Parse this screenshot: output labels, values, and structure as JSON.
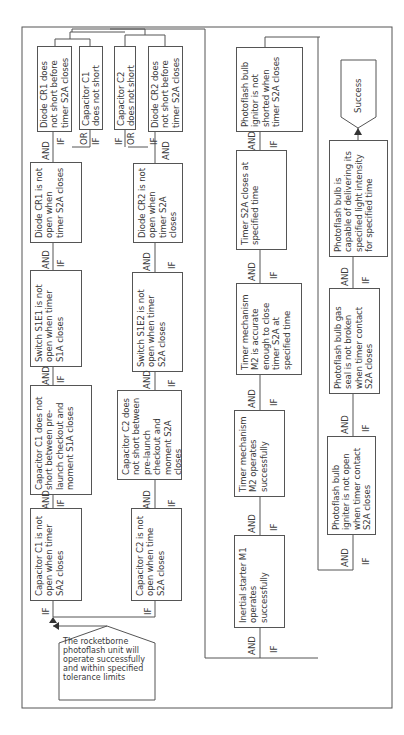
{
  "diagram": {
    "orientation": "rotated 90 degrees counter-clockwise",
    "top_event": "The rocketborne photoflash unit will operate successfully and within specified tolerance limits",
    "top_event_lines": [
      "The",
      "rocketborne",
      "photoflash",
      "unit will oper-",
      "ate successfully",
      "and within",
      "specified",
      "tolerance",
      "limits"
    ],
    "success": "Success",
    "connectors": {
      "and": "AND",
      "if": "IF",
      "or": "OR"
    },
    "branch1": {
      "c1_open": "Capacitor C1 is not open when timer SA2 closes",
      "c1_short": "Capacitor C1 does not short between pre-launch checkout and moment S1A closes",
      "s1e1": "Switch S1E1 is not open when timer S1A closes",
      "cr1_open": "Diode CR1 is not open when timer S2A closes",
      "cr1_short": "Diode CR1 does not short before timer S2A closes",
      "c1_noshort": "Capacitor C1 does not short"
    },
    "branch2": {
      "c2_open": "Capacitor C2 is not open when time S2A closes",
      "c2_short": "Capacitor C2 does not short between pre-launch checkout and moment S2A closes",
      "s1e2": "Switch S1E2 is not open when timer S2A closes",
      "cr2_open": "Diode CR2 is not open when timer S2A closes",
      "cr2_short": "Diode CR2 does not short before timer S2A closes",
      "c2_noshort": "Capacitor C2 does not short"
    },
    "branch3": {
      "inertial": "Inertial starter M1 operates successfully",
      "timer_ops": "Timer mechanism M2 operates successfully",
      "timer_accurate": "Timer mechanism M2 is accurate enough to close timer S2A at specified time",
      "timer_closes": "Timer S2A closes at specified time",
      "ignitor_short": "Photoflash bulb ignitor is not shorted when timer S2A closes"
    },
    "branch4": {
      "igniter_open": "Photoflash bulb igniter is not open when timer contact S2A closes",
      "gas_seal": "Photoflash bulb gas seal is not broken when timer contact S2A closes",
      "capable": "Photoflash bulb is capable of delivering its specified light intensity for specified time"
    },
    "colors": {
      "line": "#555555",
      "text": "#3a3a3a",
      "background": "#ffffff"
    }
  }
}
